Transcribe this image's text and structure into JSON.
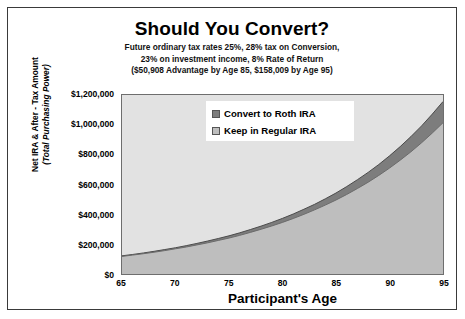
{
  "chart_data": {
    "type": "area",
    "title": "Should You Convert?",
    "subtitle_lines": [
      "Future ordinary tax rates 25%,  28% tax on Conversion,",
      "23% on investment income, 8% Rate of Return",
      "($50,908 Advantage by Age 85, $158,009 by Age 95)"
    ],
    "xlabel": "Participant's Age",
    "ylabel_line1": "Net IRA & After - Tax Amount",
    "ylabel_line2": "(Total Purchasing Power)",
    "xlim": [
      65,
      95
    ],
    "ylim": [
      0,
      1200000
    ],
    "x_ticks": [
      "65",
      "70",
      "75",
      "80",
      "85",
      "90",
      "95"
    ],
    "x_tick_values": [
      65,
      70,
      75,
      80,
      85,
      90,
      95
    ],
    "y_ticks": [
      "$0",
      "$200,000",
      "$400,000",
      "$600,000",
      "$800,000",
      "$1,000,000",
      "$1,200,000"
    ],
    "y_tick_values": [
      0,
      200000,
      400000,
      600000,
      800000,
      1000000,
      1200000
    ],
    "grid": false,
    "legend_position": "top-center",
    "plot_bg": "#e2e2e2",
    "x": [
      65,
      66,
      67,
      68,
      69,
      70,
      71,
      72,
      73,
      74,
      75,
      76,
      77,
      78,
      79,
      80,
      81,
      82,
      83,
      84,
      85,
      86,
      87,
      88,
      89,
      90,
      91,
      92,
      93,
      94,
      95
    ],
    "series": [
      {
        "name": "Convert to Roth IRA",
        "color": "#7d7d7d",
        "values": [
          122000,
          131000,
          141000,
          152000,
          164000,
          176000,
          190000,
          205000,
          221000,
          238000,
          256000,
          276000,
          298000,
          321000,
          346000,
          373000,
          402000,
          434000,
          467000,
          504000,
          543000,
          586000,
          632000,
          681000,
          734000,
          792000,
          854000,
          921000,
          993000,
          1072000,
          1156000
        ]
      },
      {
        "name": "Keep in Regular IRA",
        "color": "#bebebe",
        "values": [
          118000,
          127000,
          136000,
          146000,
          157000,
          169000,
          181000,
          195000,
          209000,
          225000,
          241000,
          259000,
          279000,
          300000,
          322000,
          346000,
          372000,
          400000,
          430000,
          462000,
          496000,
          533000,
          573000,
          615000,
          661000,
          710000,
          763000,
          819000,
          880000,
          945000,
          1014000
        ]
      }
    ]
  },
  "legend": {
    "items": [
      {
        "label": "Convert to Roth IRA",
        "color": "#7d7d7d"
      },
      {
        "label": "Keep in Regular IRA",
        "color": "#bebebe"
      }
    ]
  }
}
